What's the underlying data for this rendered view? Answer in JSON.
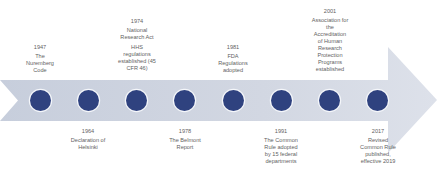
{
  "diagram": {
    "type": "timeline-arrow",
    "colors": {
      "arrow_fill": "#cfd5e1",
      "arrow_fill_light": "#dde1ea",
      "marker_fill": "#2f427f",
      "marker_border": "#f4f6fa",
      "text": "#5f5f5f"
    },
    "events_above": [
      {
        "id": "e1947",
        "year": "1947",
        "lines": [
          "The",
          "Nuremberg",
          "Code"
        ]
      },
      {
        "id": "e1974",
        "year": "1974",
        "lines": [
          "National",
          "Research Act"
        ],
        "lines2": [
          "HHS",
          "regulations",
          "established (45",
          "CFR 46)"
        ]
      },
      {
        "id": "e1981",
        "year": "1981",
        "lines": [
          "FDA",
          "Regulations",
          "adopted"
        ]
      },
      {
        "id": "e2001",
        "year": "2001",
        "lines": [
          "Association for",
          "the",
          "Accreditation",
          "of Human",
          "Research",
          "Protection",
          "Programs",
          "established"
        ]
      }
    ],
    "events_below": [
      {
        "id": "e1964",
        "year": "1964",
        "lines": [
          "Declaration of",
          "Helsinki"
        ]
      },
      {
        "id": "e1978",
        "year": "1978",
        "lines": [
          "The Belmont",
          "Report"
        ]
      },
      {
        "id": "e1991",
        "year": "1991",
        "lines": [
          "The Common",
          "Rule adopted",
          "by 15 federal",
          "departments"
        ]
      },
      {
        "id": "e2017",
        "year": "2017",
        "lines": [
          "Revised",
          "Common Rule",
          "published,",
          "effective 2019"
        ]
      }
    ],
    "markers_count": 8
  }
}
